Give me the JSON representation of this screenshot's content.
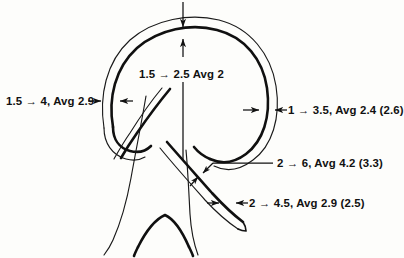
{
  "figure": {
    "background_color": "#fdfdfb",
    "ink_color": "#111111"
  },
  "annotations": {
    "ascending_left": {
      "id": "label-ascending-aorta",
      "text": "1.5 → 4, Avg 2.9",
      "range_min": "1.5",
      "range_max": "4",
      "average": "2.9"
    },
    "arch_top": {
      "id": "label-arch-top",
      "text": "1.5 → 2.5 Avg 2",
      "range_min": "1.5",
      "range_max": "2.5",
      "average": "2"
    },
    "descending_right": {
      "id": "label-descending-aorta",
      "text": "1 → 3.5, Avg 2.4 (2.6)",
      "range_min": "1",
      "range_max": "3.5",
      "average": "2.4",
      "parenthetical": "(2.6)"
    },
    "branch_upper": {
      "id": "label-branch-upper",
      "text": "2 → 6, Avg 4.2 (3.3)",
      "range_min": "2",
      "range_max": "6",
      "average": "4.2",
      "parenthetical": "(3.3)"
    },
    "branch_lower": {
      "id": "label-branch-lower",
      "text": "2 → 4.5, Avg 2.9 (2.5)",
      "range_min": "2",
      "range_max": "4.5",
      "average": "2.9",
      "parenthetical": "(2.5)"
    }
  }
}
